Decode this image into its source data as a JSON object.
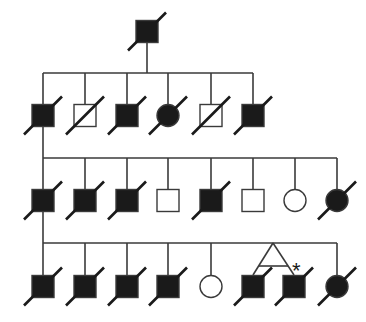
{
  "diagram": {
    "type": "pedigree",
    "title": "Pedigree chart",
    "colors": {
      "affected": "#1a1a1a",
      "line": "#3a3a3a",
      "background": "#ffffff"
    },
    "generations": [
      {
        "label": "I",
        "individuals": [
          {
            "id": "I-1",
            "sex": "male",
            "affected": true,
            "deceased": true
          }
        ]
      },
      {
        "label": "II",
        "individuals": [
          {
            "id": "II-1",
            "sex": "male",
            "affected": true,
            "deceased": true
          },
          {
            "id": "II-2",
            "sex": "male",
            "affected": false,
            "deceased": true
          },
          {
            "id": "II-3",
            "sex": "male",
            "affected": true,
            "deceased": true
          },
          {
            "id": "II-4",
            "sex": "female",
            "affected": true,
            "deceased": true
          },
          {
            "id": "II-5",
            "sex": "male",
            "affected": false,
            "deceased": true
          },
          {
            "id": "II-6",
            "sex": "male",
            "affected": true,
            "deceased": true
          }
        ]
      },
      {
        "label": "III",
        "individuals": [
          {
            "id": "III-1",
            "sex": "male",
            "affected": true,
            "deceased": true
          },
          {
            "id": "III-2",
            "sex": "male",
            "affected": true,
            "deceased": true
          },
          {
            "id": "III-3",
            "sex": "male",
            "affected": true,
            "deceased": true
          },
          {
            "id": "III-4",
            "sex": "male",
            "affected": false,
            "deceased": false
          },
          {
            "id": "III-5",
            "sex": "male",
            "affected": true,
            "deceased": true
          },
          {
            "id": "III-6",
            "sex": "male",
            "affected": false,
            "deceased": false
          },
          {
            "id": "III-7",
            "sex": "female",
            "affected": false,
            "deceased": false
          },
          {
            "id": "III-8",
            "sex": "female",
            "affected": true,
            "deceased": true
          }
        ]
      },
      {
        "label": "IV",
        "individuals": [
          {
            "id": "IV-1",
            "sex": "male",
            "affected": true,
            "deceased": true
          },
          {
            "id": "IV-2",
            "sex": "male",
            "affected": true,
            "deceased": true
          },
          {
            "id": "IV-3",
            "sex": "male",
            "affected": true,
            "deceased": true
          },
          {
            "id": "IV-4",
            "sex": "male",
            "affected": true,
            "deceased": true
          },
          {
            "id": "IV-5",
            "sex": "female",
            "affected": false,
            "deceased": false
          },
          {
            "id": "IV-6",
            "sex": "male",
            "affected": true,
            "deceased": true,
            "twin": "monozygotic"
          },
          {
            "id": "IV-7",
            "sex": "male",
            "affected": true,
            "deceased": true,
            "twin": "monozygotic",
            "proband_mark": "*"
          },
          {
            "id": "IV-8",
            "sex": "female",
            "affected": true,
            "deceased": true
          }
        ]
      }
    ],
    "annotation": "*"
  }
}
